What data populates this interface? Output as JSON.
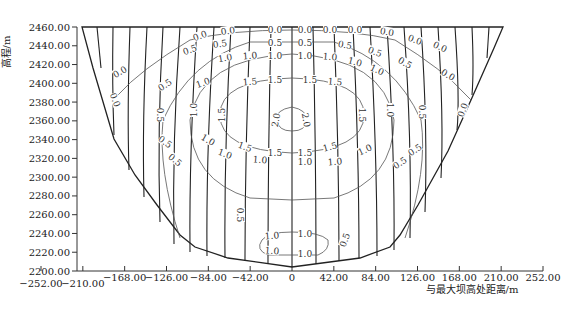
{
  "chart_data": {
    "type": "contour",
    "title": "",
    "xlabel": "与最大坝高处距离/m",
    "ylabel": "高程/m",
    "xlim": [
      -252,
      252
    ],
    "ylim": [
      2200,
      2460
    ],
    "x_ticks": [
      "-252.00",
      "-210.00",
      "-168.00",
      "-126.00",
      "-84.00",
      "-42.00",
      "0",
      "42.00",
      "84.00",
      "126.00",
      "168.00",
      "210.00",
      "252.00"
    ],
    "y_ticks": [
      "2200.00",
      "2220.00",
      "2240.00",
      "2260.00",
      "2280.00",
      "2300.00",
      "2320.00",
      "2340.00",
      "2360.00",
      "2380.00",
      "2400.00",
      "2420.00",
      "2440.00",
      "2460.00"
    ],
    "contour_levels": [
      0.0,
      0.5,
      1.0,
      1.5,
      2.0
    ],
    "contour_labels": [
      "0.0",
      "0.5",
      "1.0",
      "1.5",
      "2.0"
    ],
    "valley_profile": {
      "crest_elevation": 2460,
      "crest_left_x": -210,
      "crest_right_x": 210,
      "bottom_elevation": 2204,
      "bottom_x": 0
    },
    "grid": false,
    "legend": null
  }
}
